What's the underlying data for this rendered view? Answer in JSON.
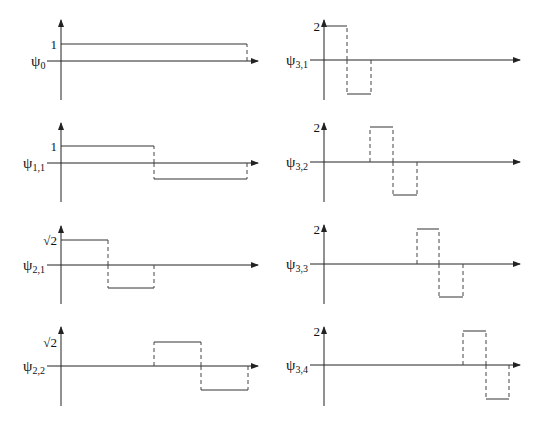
{
  "figure": {
    "panels": [
      {
        "id": "psi0",
        "label_base": "ψ",
        "label_sub": "0",
        "level_label": "1",
        "origin": [
          61,
          61
        ],
        "x_end": 258,
        "y_top": 20,
        "y_bottom": 100,
        "level_y": 44,
        "neg_y": null,
        "pulses": [
          {
            "x0": 61,
            "x1": 247,
            "sign": 1
          }
        ]
      },
      {
        "id": "psi31",
        "label_base": "ψ",
        "label_sub": "3,1",
        "level_label": "2",
        "origin": [
          324,
          60
        ],
        "x_end": 520,
        "y_top": 20,
        "y_bottom": 100,
        "level_y": 26,
        "neg_y": 94,
        "pulses": [
          {
            "x0": 324,
            "x1": 347,
            "sign": 1
          },
          {
            "x0": 347,
            "x1": 371,
            "sign": -1
          }
        ]
      },
      {
        "id": "psi11",
        "label_base": "ψ",
        "label_sub": "1,1",
        "level_label": "1",
        "origin": [
          61,
          163
        ],
        "x_end": 258,
        "y_top": 123,
        "y_bottom": 202,
        "level_y": 146,
        "neg_y": 179,
        "pulses": [
          {
            "x0": 61,
            "x1": 154,
            "sign": 1
          },
          {
            "x0": 154,
            "x1": 247,
            "sign": -1
          }
        ]
      },
      {
        "id": "psi32",
        "label_base": "ψ",
        "label_sub": "3,2",
        "level_label": "2",
        "origin": [
          324,
          162
        ],
        "x_end": 520,
        "y_top": 123,
        "y_bottom": 202,
        "level_y": 127,
        "neg_y": 195,
        "pulses": [
          {
            "x0": 370,
            "x1": 393,
            "sign": 1
          },
          {
            "x0": 393,
            "x1": 417,
            "sign": -1
          }
        ]
      },
      {
        "id": "psi21",
        "label_base": "ψ",
        "label_sub": "2,1",
        "level_label": "√2",
        "origin": [
          61,
          265
        ],
        "x_end": 258,
        "y_top": 226,
        "y_bottom": 304,
        "level_y": 240,
        "neg_y": 288,
        "pulses": [
          {
            "x0": 61,
            "x1": 108,
            "sign": 1
          },
          {
            "x0": 108,
            "x1": 154,
            "sign": -1
          }
        ]
      },
      {
        "id": "psi33",
        "label_base": "ψ",
        "label_sub": "3,3",
        "level_label": "2",
        "origin": [
          324,
          264
        ],
        "x_end": 520,
        "y_top": 225,
        "y_bottom": 304,
        "level_y": 229,
        "neg_y": 297,
        "pulses": [
          {
            "x0": 417,
            "x1": 439,
            "sign": 1
          },
          {
            "x0": 439,
            "x1": 463,
            "sign": -1
          }
        ]
      },
      {
        "id": "psi22",
        "label_base": "ψ",
        "label_sub": "2,2",
        "level_label": "√2",
        "origin": [
          61,
          366
        ],
        "x_end": 258,
        "y_top": 327,
        "y_bottom": 406,
        "level_y": 342,
        "neg_y": 390,
        "pulses": [
          {
            "x0": 154,
            "x1": 201,
            "sign": 1
          },
          {
            "x0": 201,
            "x1": 248,
            "sign": -1
          }
        ]
      },
      {
        "id": "psi34",
        "label_base": "ψ",
        "label_sub": "3,4",
        "level_label": "2",
        "origin": [
          324,
          365
        ],
        "x_end": 520,
        "y_top": 327,
        "y_bottom": 406,
        "level_y": 331,
        "neg_y": 399,
        "pulses": [
          {
            "x0": 463,
            "x1": 486,
            "sign": 1
          },
          {
            "x0": 486,
            "x1": 509,
            "sign": -1
          }
        ]
      }
    ]
  }
}
